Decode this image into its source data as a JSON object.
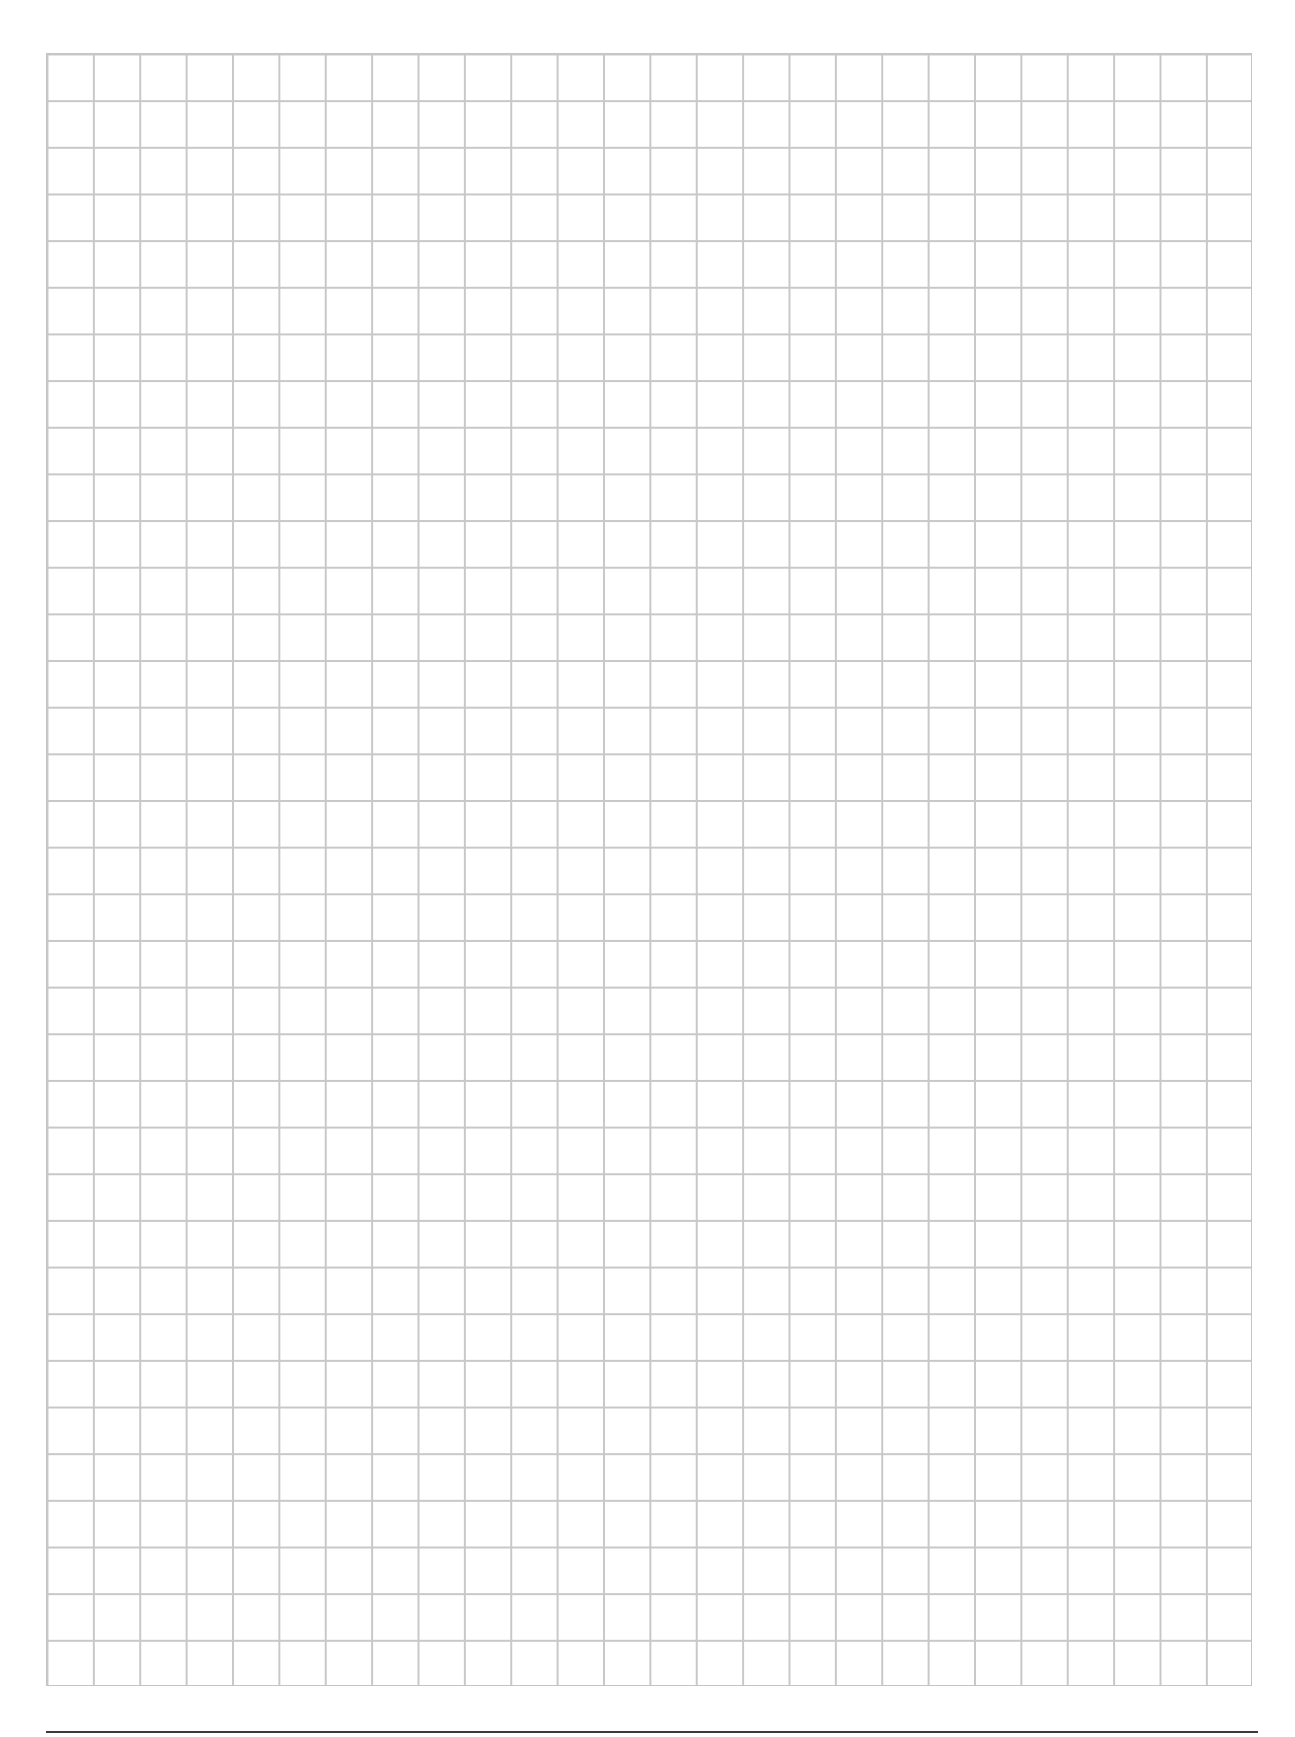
{
  "page": {
    "type": "grid-paper",
    "grid": {
      "columns": 26,
      "rows": 35,
      "line_color": "#c8c8c8"
    },
    "footer_rule": {
      "color": "#3a3a3a"
    }
  }
}
